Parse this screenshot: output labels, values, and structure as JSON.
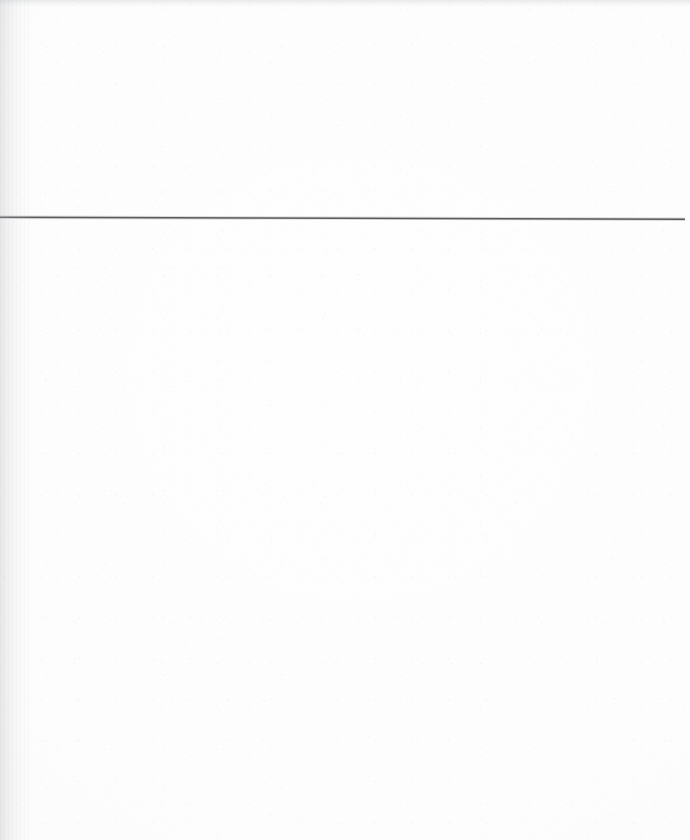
{
  "page": {
    "type": "scanned-document-page",
    "width": 690,
    "height": 840,
    "background_color": "#fdfdfd",
    "content_text": "",
    "is_blank": true
  },
  "rule": {
    "name": "horizontal-rule",
    "color": "#5a5a5e",
    "thickness_px": 1.6,
    "x_start": 0,
    "y_start": 217.2,
    "x_end": 685,
    "y_end": 219.2
  },
  "artifacts": {
    "left_gutter_shadow_color": "#b0b2b6",
    "top_edge_shadow_color": "#acaeb4",
    "grain_color": "#b4b4b9"
  }
}
